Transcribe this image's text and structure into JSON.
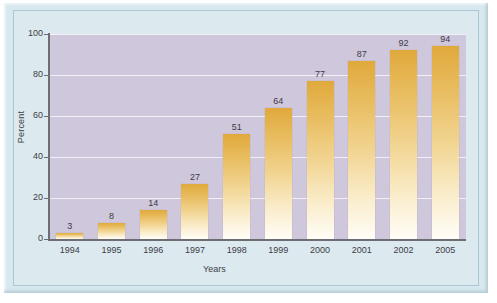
{
  "chart_data": {
    "type": "bar",
    "title": "",
    "subtitle": "",
    "xlabel": "Years",
    "ylabel": "Percent",
    "categories": [
      "1994",
      "1995",
      "1996",
      "1997",
      "1998",
      "1999",
      "2000",
      "2001",
      "2002",
      "2005"
    ],
    "values": [
      3,
      8,
      14,
      27,
      51,
      64,
      77,
      87,
      92,
      94
    ],
    "value_labels": [
      "3",
      "8",
      "14",
      "27",
      "51",
      "64",
      "77",
      "87",
      "92",
      "94"
    ],
    "ylim": [
      0,
      100
    ],
    "y_ticks": [
      0,
      20,
      40,
      60,
      80,
      100
    ],
    "y_tick_labels": [
      "0",
      "20",
      "40",
      "60",
      "80",
      "100"
    ],
    "grid": "horizontal",
    "legend": "none",
    "series": [
      {
        "name": "Percent",
        "values": [
          3,
          8,
          14,
          27,
          51,
          64,
          77,
          87,
          92,
          94
        ]
      }
    ]
  },
  "colors": {
    "page_background": "#d7e8ee",
    "plot_background": "#cfc7dc",
    "gridline": "#f2eff7",
    "axis_line": "#6d6d74",
    "bar_top": "#e0a93c",
    "bar_bottom": "#fffdf7",
    "text": "#3c3c44",
    "frame_border": "#a9c6d2"
  }
}
